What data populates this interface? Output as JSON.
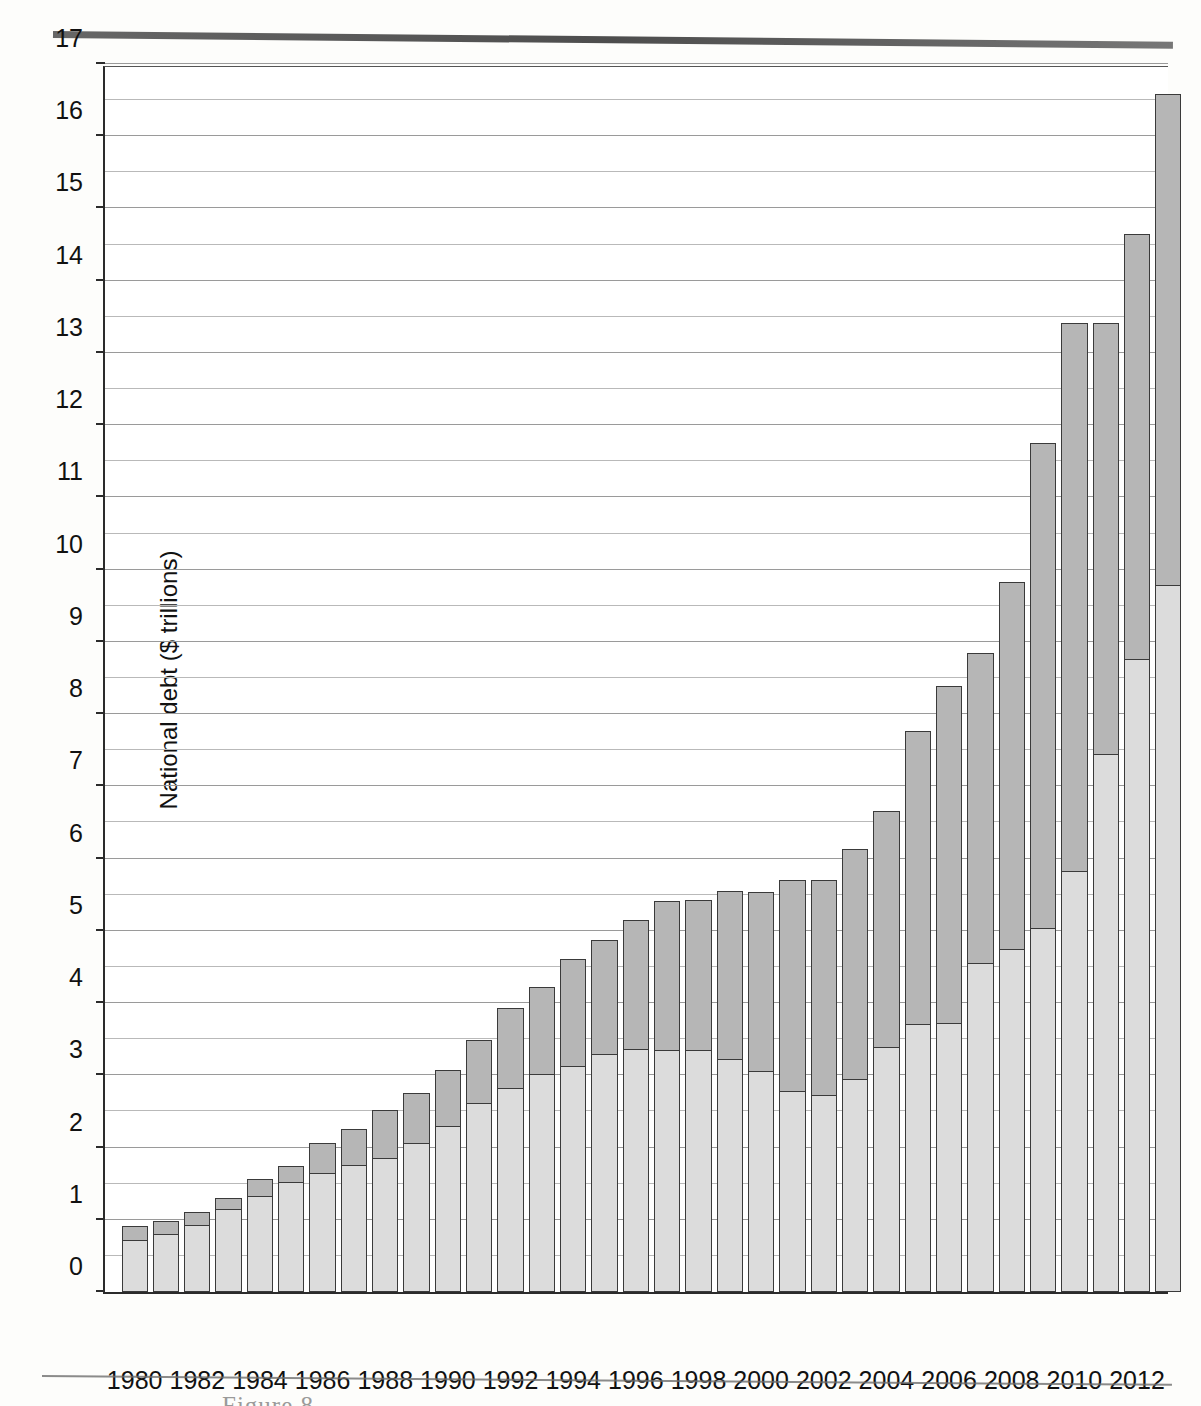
{
  "page": {
    "figure_caption_partial": "Figure 8"
  },
  "chart_data": {
    "type": "bar",
    "stacked": true,
    "title": "",
    "xlabel": "Year",
    "ylabel": "National debt ($ trillions)",
    "ylim": [
      0,
      17
    ],
    "ytick_step": 1,
    "minor_gridline_step": 0.5,
    "grid": true,
    "legend_position": "none",
    "ytick_labels": [
      "0",
      "1",
      "2",
      "3",
      "4",
      "5",
      "6",
      "7",
      "8",
      "9",
      "10",
      "11",
      "12",
      "13",
      "14",
      "15",
      "16",
      "17"
    ],
    "xtick_labels": [
      "1980",
      "1982",
      "1984",
      "1986",
      "1988",
      "1990",
      "1992",
      "1994",
      "1996",
      "1998",
      "2000",
      "2002",
      "2004",
      "2006",
      "2008",
      "2010",
      "2012"
    ],
    "categories": [
      1980,
      1981,
      1982,
      1983,
      1984,
      1985,
      1986,
      1987,
      1988,
      1989,
      1990,
      1991,
      1992,
      1993,
      1994,
      1995,
      1996,
      1997,
      1998,
      1999,
      2000,
      2001,
      2002,
      2003,
      2004,
      2005,
      2006,
      2007,
      2008,
      2009,
      2010,
      2011,
      2012,
      2013
    ],
    "series": [
      {
        "name": "Debt held by the public",
        "color": "#dcdcdc",
        "values": [
          0.71,
          0.79,
          0.92,
          1.14,
          1.31,
          1.51,
          1.63,
          1.75,
          1.84,
          2.05,
          2.29,
          2.6,
          2.81,
          3.0,
          3.12,
          3.28,
          3.35,
          3.34,
          3.33,
          3.21,
          3.05,
          2.77,
          2.71,
          2.94,
          3.38,
          3.7,
          3.71,
          4.54,
          4.74,
          5.02,
          5.82,
          7.44,
          8.75,
          9.78
        ]
      },
      {
        "name": "Intragovernmental holdings",
        "color": "#b6b6b6",
        "values": [
          0.2,
          0.19,
          0.19,
          0.16,
          0.25,
          0.24,
          0.43,
          0.51,
          0.68,
          0.7,
          0.79,
          0.89,
          1.12,
          1.22,
          1.49,
          1.59,
          1.8,
          2.07,
          2.1,
          2.34,
          2.49,
          2.94,
          3.0,
          3.2,
          3.28,
          4.07,
          4.68,
          4.3,
          5.09,
          6.74,
          7.6,
          5.97,
          5.9,
          6.8
        ]
      }
    ],
    "totals": [
      0.91,
      0.98,
      1.11,
      1.3,
      1.56,
      1.75,
      2.06,
      2.26,
      2.52,
      2.75,
      3.08,
      3.49,
      3.93,
      4.22,
      4.61,
      4.87,
      5.15,
      5.41,
      5.43,
      5.55,
      5.54,
      5.71,
      6.13,
      6.64,
      7.27,
      7.77,
      8.39,
      8.84,
      9.83,
      11.76,
      13.42,
      14.65,
      15.91,
      16.58
    ]
  }
}
